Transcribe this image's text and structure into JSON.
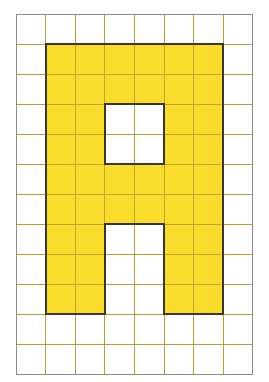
{
  "figure": {
    "depicted_glyph": "A"
  },
  "canvas": {
    "width": 269,
    "height": 382,
    "background_color": "#ffffff"
  },
  "grid": {
    "columns": 8,
    "rows": 12,
    "cell_width": 29.6,
    "cell_height": 30.0,
    "origin_x": 16,
    "origin_y": 14,
    "line_color": "#9a9a9a",
    "line_width": 1,
    "outer_border_color": "#8a8a8a"
  },
  "shape": {
    "name": "letter-a",
    "fill_color": "#f9dc2c",
    "outline_color": "#3d3527",
    "outline_width": 2,
    "filled_cell_count": 38,
    "bounding_box": {
      "col_start": 1,
      "col_end": 6,
      "row_start": 1,
      "row_end": 9
    },
    "filled_cells": [
      [
        1,
        1
      ],
      [
        2,
        1
      ],
      [
        3,
        1
      ],
      [
        4,
        1
      ],
      [
        5,
        1
      ],
      [
        6,
        1
      ],
      [
        1,
        2
      ],
      [
        2,
        2
      ],
      [
        3,
        2
      ],
      [
        4,
        2
      ],
      [
        5,
        2
      ],
      [
        6,
        2
      ],
      [
        1,
        3
      ],
      [
        2,
        3
      ],
      [
        5,
        3
      ],
      [
        6,
        3
      ],
      [
        1,
        4
      ],
      [
        2,
        4
      ],
      [
        5,
        4
      ],
      [
        6,
        4
      ],
      [
        1,
        5
      ],
      [
        2,
        5
      ],
      [
        3,
        5
      ],
      [
        4,
        5
      ],
      [
        5,
        5
      ],
      [
        6,
        5
      ],
      [
        1,
        6
      ],
      [
        2,
        6
      ],
      [
        3,
        6
      ],
      [
        4,
        6
      ],
      [
        5,
        6
      ],
      [
        6,
        6
      ],
      [
        1,
        7
      ],
      [
        2,
        7
      ],
      [
        5,
        7
      ],
      [
        6,
        7
      ],
      [
        1,
        8
      ],
      [
        2,
        8
      ],
      [
        5,
        8
      ],
      [
        6,
        8
      ],
      [
        1,
        9
      ],
      [
        2,
        9
      ],
      [
        5,
        9
      ],
      [
        6,
        9
      ]
    ],
    "holes": [
      {
        "name": "counter",
        "col_start": 3,
        "col_end": 4,
        "row_start": 3,
        "row_end": 4
      },
      {
        "name": "leg-gap",
        "col_start": 3,
        "col_end": 4,
        "row_start": 7,
        "row_end": 9
      }
    ],
    "outline_path": "M1,1 L7,1 L7,10 L5,10 L5,7 L3,7 L3,10 L1,10 Z",
    "counter_path": "M3,3 L5,3 L5,5 L3,5 Z"
  }
}
